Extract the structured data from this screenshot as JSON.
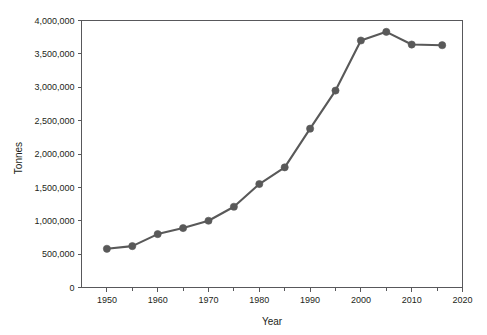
{
  "chart_data": {
    "type": "line",
    "title": "",
    "xlabel": "Year",
    "ylabel": "Tonnes",
    "xlim": [
      1945,
      2020
    ],
    "ylim": [
      0,
      4000000
    ],
    "grid": false,
    "legend": false,
    "legend_position": "none",
    "series_color": "#595959",
    "axis_color": "#58585b",
    "x": [
      1950,
      1955,
      1960,
      1965,
      1970,
      1975,
      1980,
      1985,
      1990,
      1995,
      2000,
      2005,
      2010,
      2016
    ],
    "values": [
      580000,
      620000,
      800000,
      890000,
      1000000,
      1210000,
      1550000,
      1800000,
      2380000,
      2950000,
      3700000,
      3830000,
      3640000,
      3630000
    ],
    "series": [
      {
        "name": "Tonnes",
        "values": [
          580000,
          620000,
          800000,
          890000,
          1000000,
          1210000,
          1550000,
          1800000,
          2380000,
          2950000,
          3700000,
          3830000,
          3640000,
          3630000
        ]
      }
    ],
    "x_ticks": [
      1950,
      1960,
      1970,
      1980,
      1990,
      2000,
      2010,
      2020
    ],
    "x_tick_labels": [
      "1950",
      "1960",
      "1970",
      "1980",
      "1990",
      "2000",
      "2010",
      "2020"
    ],
    "x_minor_ticks": [
      1955,
      1965,
      1975,
      1985,
      1995,
      2005,
      2015
    ],
    "y_ticks": [
      0,
      500000,
      1000000,
      1500000,
      2000000,
      2500000,
      3000000,
      3500000,
      4000000
    ],
    "y_tick_labels": [
      "0",
      "500,000",
      "1,000,000",
      "1,500,000",
      "2,000,000",
      "2,500,000",
      "3,000,000",
      "3,500,000",
      "4,000,000"
    ]
  }
}
